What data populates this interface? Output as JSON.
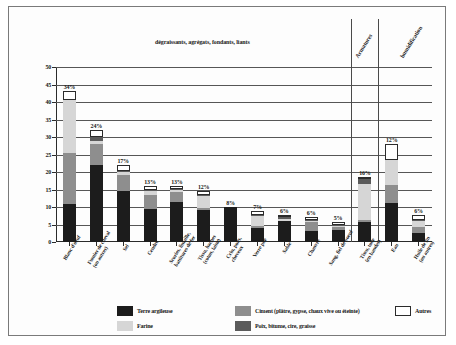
{
  "chart_data": {
    "type": "bar",
    "subtype": "stacked-vertical",
    "title": "dégraissants, agrégats, fondants, liants",
    "xlabel": "",
    "ylabel": "",
    "ylim": [
      0,
      50
    ],
    "yticks": [
      0,
      5,
      10,
      15,
      20,
      25,
      30,
      35,
      40,
      45,
      50
    ],
    "grid": true,
    "legend_position": "bottom",
    "categories": [
      "Blanc d'oeuf",
      "Fumier de cheval (ou autres)",
      "Sel",
      "Cendre",
      "Scories, limaille, battitures de fer",
      "Tissu, haches (coton, laine)",
      "Crin, poils, cheveux",
      "Verre pilé",
      "Sable",
      "Chanvre",
      "Sang, fiel de boeuf",
      "Tissu, toile (en bandes)",
      "Eau",
      "Huile de lin (ou autres)"
    ],
    "category_lines": [
      [
        "Blanc d'oeuf"
      ],
      [
        "Fumier de cheval",
        "(ou autres)"
      ],
      [
        "Sel"
      ],
      [
        "Cendre"
      ],
      [
        "Scories, limaille,",
        "battitures de fer"
      ],
      [
        "Tissu, haches",
        "(coton, laine)"
      ],
      [
        "Crin, poils,",
        "cheveux"
      ],
      [
        "Verre pilé"
      ],
      [
        "Sable"
      ],
      [
        "Chanvre"
      ],
      [
        "Sang, fiel de boeuf"
      ],
      [
        "Tissu, toile",
        "(en bandes)"
      ],
      [
        "Eau"
      ],
      [
        "Huile de lin",
        "(ou autres)"
      ]
    ],
    "series": [
      {
        "name": "Terre argileuse",
        "color": "#1c1c1c",
        "values": [
          10.8,
          22.0,
          14.7,
          9.4,
          11.5,
          9.1,
          9.9,
          4.2,
          6.2,
          3.4,
          3.6,
          5.8,
          11.2,
          2.6
        ]
      },
      {
        "name": "Ciment (plâtre, gypse, chaux vive ou éteinte)",
        "color": "#8e8e8e",
        "values": [
          14.6,
          6.0,
          4.4,
          4.0,
          2.8,
          0.6,
          0.0,
          0.5,
          0.0,
          2.6,
          0.7,
          0.5,
          5.0,
          1.9
        ]
      },
      {
        "name": "Farine",
        "color": "#d6d6d6",
        "values": [
          15.2,
          0.9,
          0.8,
          1.2,
          0.7,
          3.6,
          0.0,
          2.9,
          0.6,
          0.2,
          0.5,
          10.4,
          7.3,
          1.5
        ]
      },
      {
        "name": "Poix, bitume, cire, graisse",
        "color": "#5b5b5b",
        "values": [
          0.0,
          1.2,
          0.3,
          0.3,
          0.2,
          0.2,
          0.0,
          0.2,
          0.2,
          0.2,
          0.2,
          1.3,
          0.0,
          0.2
        ]
      },
      {
        "name": "Autres",
        "color": "#ffffff",
        "values": [
          2.6,
          1.8,
          1.9,
          1.1,
          0.7,
          1.2,
          0.0,
          1.2,
          0.7,
          0.8,
          0.7,
          0.5,
          4.5,
          1.5
        ]
      }
    ],
    "data_labels": [
      "34%",
      "24%",
      "17%",
      "13%",
      "13%",
      "12%",
      "8%",
      "7%",
      "6%",
      "6%",
      "5%",
      "16%",
      "12%",
      "6%"
    ],
    "group_headers": [
      {
        "label": "dégraissants, agrégats, fondants, liants",
        "rotated": false
      },
      {
        "label": "Armatures",
        "rotated": true
      },
      {
        "label": "humidification",
        "rotated": true
      }
    ],
    "separators": [
      11,
      12
    ]
  },
  "legend": {
    "items": [
      {
        "label": "Terre argileuse",
        "color": "#1c1c1c"
      },
      {
        "label": "Ciment (plâtre, gypse, chaux vive ou éteinte)",
        "color": "#8e8e8e"
      },
      {
        "label": "Autres",
        "color": "#ffffff"
      },
      {
        "label": "Farine",
        "color": "#d6d6d6"
      },
      {
        "label": "Poix, bitume, cire, graisse",
        "color": "#5b5b5b"
      }
    ]
  }
}
